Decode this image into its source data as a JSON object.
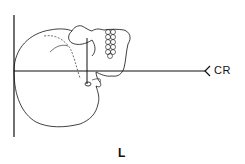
{
  "diagram": {
    "type": "radiographic-positioning",
    "labels": {
      "central_ray": "CR",
      "side_marker": "L"
    },
    "colors": {
      "line": "#111111",
      "background": "#ffffff"
    }
  }
}
